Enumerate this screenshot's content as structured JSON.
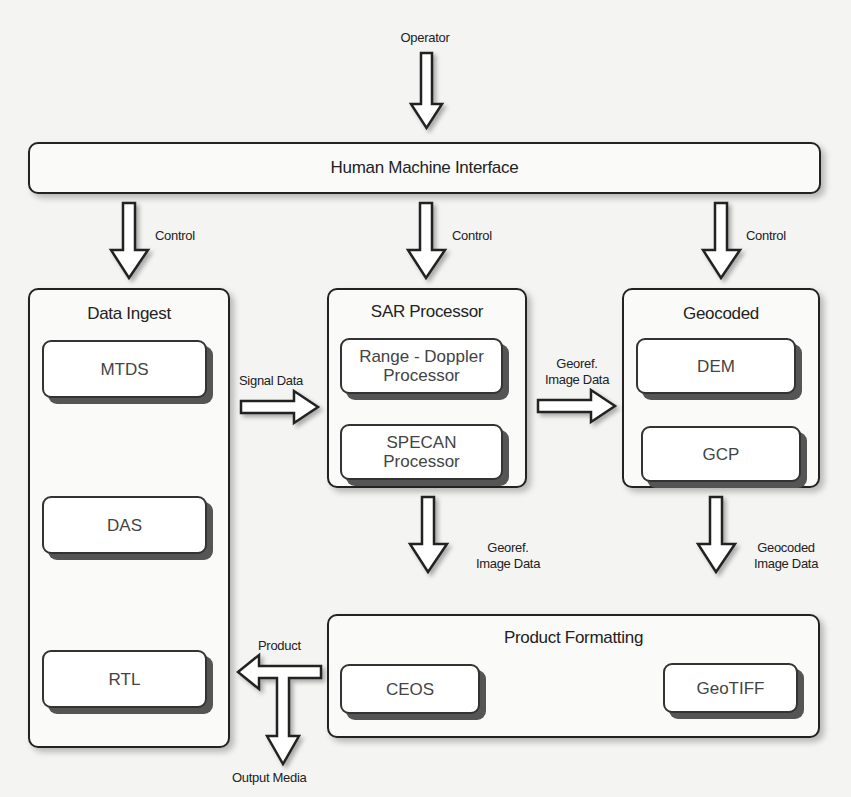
{
  "diagram": {
    "operator_label": "Operator",
    "hmi": {
      "title": "Human Machine Interface"
    },
    "control_labels": [
      "Control",
      "Control",
      "Control"
    ],
    "data_ingest": {
      "title": "Data Ingest",
      "items": [
        "MTDS",
        "DAS",
        "RTL"
      ]
    },
    "sar_processor": {
      "title": "SAR Processor",
      "items": [
        {
          "line1": "Range - Doppler",
          "line2": "Processor"
        },
        {
          "line1": "SPECAN",
          "line2": "Processor"
        }
      ]
    },
    "geocoded": {
      "title": "Geocoded",
      "items": [
        "DEM",
        "GCP"
      ]
    },
    "product_formatting": {
      "title": "Product Formatting",
      "items": [
        "CEOS",
        "GeoTIFF"
      ]
    },
    "flow_labels": {
      "signal_data": "Signal Data",
      "georef_h_line1": "Georef.",
      "georef_h_line2": "Image Data",
      "georef_v_line1": "Georef.",
      "georef_v_line2": "Image Data",
      "geocoded_v_line1": "Geocoded",
      "geocoded_v_line2": "Image Data",
      "product": "Product",
      "output_media": "Output Media"
    }
  }
}
